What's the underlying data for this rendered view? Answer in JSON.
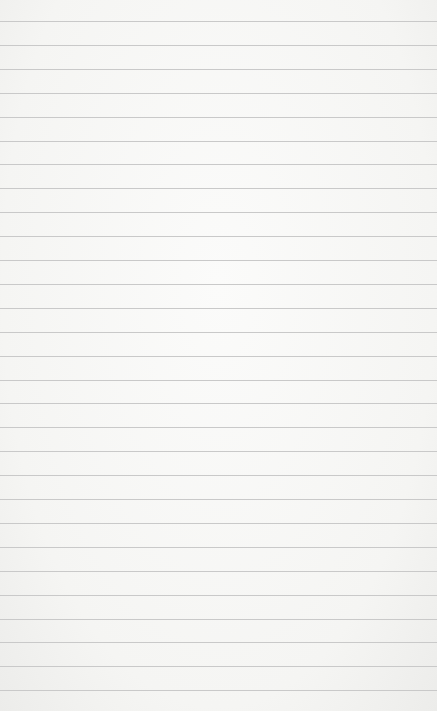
{
  "paper": {
    "background": "#f7f7f5",
    "line_color": "#c9c9c9",
    "first_line_y": 21,
    "line_spacing": 23.9,
    "line_count": 29
  }
}
